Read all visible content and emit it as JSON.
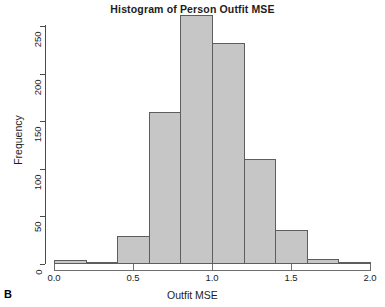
{
  "panel": {
    "letter": "B"
  },
  "chart_data": {
    "type": "bar",
    "title": "Histogram of Person Outfit MSE",
    "xlabel": "Outfit MSE",
    "ylabel": "Frequency",
    "xlim": [
      0.0,
      2.0
    ],
    "ylim": [
      0,
      262
    ],
    "grid": false,
    "legend": null,
    "bin_width": 0.2,
    "bin_edges": [
      0.0,
      0.2,
      0.4,
      0.6,
      0.8,
      1.0,
      1.2,
      1.4,
      1.6,
      1.8,
      2.0
    ],
    "categories": [
      "0.0-0.2",
      "0.2-0.4",
      "0.4-0.6",
      "0.6-0.8",
      "0.8-1.0",
      "1.0-1.2",
      "1.2-1.4",
      "1.4-1.6",
      "1.6-1.8",
      "1.8-2.0"
    ],
    "values": [
      4,
      2,
      29,
      160,
      262,
      232,
      110,
      36,
      5,
      2
    ],
    "bar_fill_color": "#c6c6c6",
    "bar_border_color": "#5d5d5d",
    "xticks": [
      {
        "value": 0.0,
        "label": "0.0"
      },
      {
        "value": 0.5,
        "label": "0.5"
      },
      {
        "value": 1.0,
        "label": "1.0"
      },
      {
        "value": 1.5,
        "label": "1.5"
      },
      {
        "value": 2.0,
        "label": "2.0"
      }
    ],
    "yticks": [
      {
        "value": 0,
        "label": "0"
      },
      {
        "value": 50,
        "label": "50"
      },
      {
        "value": 100,
        "label": "100"
      },
      {
        "value": 150,
        "label": "150"
      },
      {
        "value": 200,
        "label": "200"
      },
      {
        "value": 250,
        "label": "250"
      }
    ]
  }
}
